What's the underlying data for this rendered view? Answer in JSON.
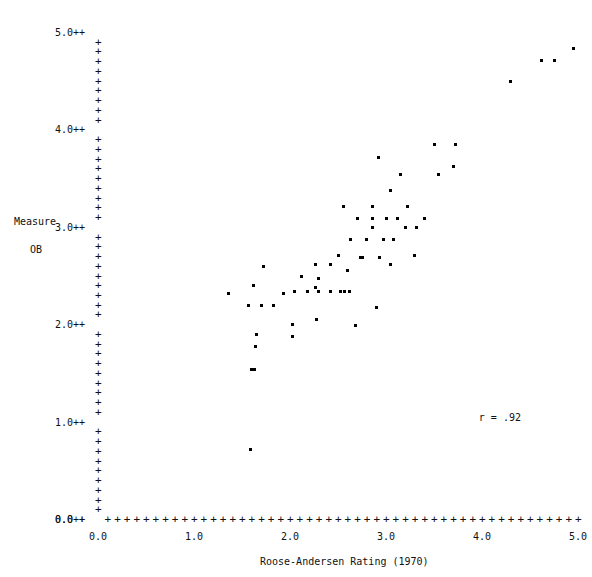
{
  "chart_data": {
    "type": "scatter",
    "title": "",
    "xlabel": "Roose-Andersen Rating (1970)",
    "ylabel_line1": "Measure",
    "ylabel_line2": "OB",
    "xlim": [
      0.0,
      5.0
    ],
    "ylim": [
      0.0,
      5.0
    ],
    "xticks": [
      0.0,
      1.0,
      2.0,
      3.0,
      4.0,
      5.0
    ],
    "yticks": [
      0.0,
      1.0,
      2.0,
      3.0,
      4.0,
      5.0
    ],
    "xtick_labels": [
      "0.0",
      "1.0",
      "2.0",
      "3.0",
      "4.0",
      "5.0"
    ],
    "ytick_labels": [
      "0.0",
      "1.0",
      "2.0",
      "3.0",
      "4.0",
      "5.0"
    ],
    "minor_ticks_per_unit": 10,
    "grid": false,
    "legend": null,
    "axis_glyph": "+",
    "tick_label_suffix": "++",
    "annotations": [
      {
        "name": "correlation",
        "text": "r = .92",
        "x": 4.05,
        "y": 1.05
      }
    ],
    "points": [
      {
        "x": 1.36,
        "y": 2.33
      },
      {
        "x": 1.59,
        "y": 0.72
      },
      {
        "x": 1.6,
        "y": 1.55
      },
      {
        "x": 1.63,
        "y": 1.55
      },
      {
        "x": 1.64,
        "y": 1.78
      },
      {
        "x": 1.65,
        "y": 1.9
      },
      {
        "x": 1.57,
        "y": 2.2
      },
      {
        "x": 1.7,
        "y": 2.2
      },
      {
        "x": 1.83,
        "y": 2.2
      },
      {
        "x": 1.62,
        "y": 2.41
      },
      {
        "x": 2.03,
        "y": 2.01
      },
      {
        "x": 2.03,
        "y": 1.88
      },
      {
        "x": 2.28,
        "y": 2.06
      },
      {
        "x": 2.27,
        "y": 2.39
      },
      {
        "x": 2.05,
        "y": 2.35
      },
      {
        "x": 2.18,
        "y": 2.35
      },
      {
        "x": 2.3,
        "y": 2.35
      },
      {
        "x": 2.42,
        "y": 2.35
      },
      {
        "x": 2.53,
        "y": 2.35
      },
      {
        "x": 2.62,
        "y": 2.35
      },
      {
        "x": 1.93,
        "y": 2.33
      },
      {
        "x": 2.12,
        "y": 2.5
      },
      {
        "x": 2.3,
        "y": 2.48
      },
      {
        "x": 2.27,
        "y": 2.62
      },
      {
        "x": 2.42,
        "y": 2.62
      },
      {
        "x": 2.5,
        "y": 2.72
      },
      {
        "x": 1.72,
        "y": 2.6
      },
      {
        "x": 2.57,
        "y": 2.35
      },
      {
        "x": 2.6,
        "y": 2.56
      },
      {
        "x": 2.68,
        "y": 2.0
      },
      {
        "x": 2.9,
        "y": 2.18
      },
      {
        "x": 2.73,
        "y": 2.7
      },
      {
        "x": 2.75,
        "y": 2.7
      },
      {
        "x": 2.93,
        "y": 2.7
      },
      {
        "x": 2.63,
        "y": 2.88
      },
      {
        "x": 2.8,
        "y": 2.88
      },
      {
        "x": 2.97,
        "y": 2.88
      },
      {
        "x": 3.08,
        "y": 2.88
      },
      {
        "x": 2.86,
        "y": 3.0
      },
      {
        "x": 3.2,
        "y": 3.0
      },
      {
        "x": 3.32,
        "y": 3.0
      },
      {
        "x": 2.7,
        "y": 3.1
      },
      {
        "x": 2.86,
        "y": 3.1
      },
      {
        "x": 3.0,
        "y": 3.1
      },
      {
        "x": 3.12,
        "y": 3.1
      },
      {
        "x": 3.4,
        "y": 3.1
      },
      {
        "x": 2.56,
        "y": 3.22
      },
      {
        "x": 2.86,
        "y": 3.22
      },
      {
        "x": 3.22,
        "y": 3.22
      },
      {
        "x": 3.05,
        "y": 3.38
      },
      {
        "x": 3.15,
        "y": 3.55
      },
      {
        "x": 3.05,
        "y": 2.62
      },
      {
        "x": 3.3,
        "y": 2.72
      },
      {
        "x": 2.92,
        "y": 3.72
      },
      {
        "x": 3.55,
        "y": 3.55
      },
      {
        "x": 3.7,
        "y": 3.63
      },
      {
        "x": 3.5,
        "y": 3.86
      },
      {
        "x": 3.72,
        "y": 3.86
      },
      {
        "x": 4.3,
        "y": 4.5
      },
      {
        "x": 4.62,
        "y": 4.72
      },
      {
        "x": 4.76,
        "y": 4.72
      },
      {
        "x": 4.95,
        "y": 4.84
      }
    ]
  }
}
